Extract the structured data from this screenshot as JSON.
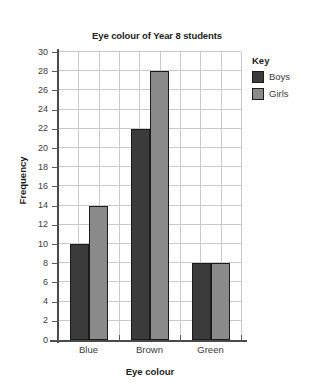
{
  "chart_data": {
    "type": "bar",
    "title": "Eye colour of Year 8 students",
    "xlabel": "Eye colour",
    "ylabel": "Frequency",
    "categories": [
      "Blue",
      "Brown",
      "Green"
    ],
    "series": [
      {
        "name": "Boys",
        "color": "#3b3b3b",
        "values": [
          10,
          22,
          8
        ]
      },
      {
        "name": "Girls",
        "color": "#8a8a8a",
        "values": [
          14,
          28,
          8
        ]
      }
    ],
    "ylim": [
      0,
      30
    ],
    "ytick_step": 2,
    "yticks": [
      0,
      2,
      4,
      6,
      8,
      10,
      12,
      14,
      16,
      18,
      20,
      22,
      24,
      26,
      28,
      30
    ],
    "ytick_labels": [
      "0",
      "2",
      "4",
      "6",
      "8",
      "10",
      "12",
      "14",
      "16",
      "18",
      "20",
      "22",
      "24",
      "26",
      "28",
      "30"
    ],
    "grid": true,
    "grid_color": "#c9c9c9",
    "legend_position": "right",
    "legend_title": "Key",
    "axis_color": "#4a4a4a",
    "bar_edge_color": "#1b1b1b",
    "background": "#ffffff"
  },
  "legend": {
    "title": "Key",
    "entries": [
      {
        "label": "Boys",
        "color": "#3b3b3b"
      },
      {
        "label": "Girls",
        "color": "#8a8a8a"
      }
    ]
  }
}
